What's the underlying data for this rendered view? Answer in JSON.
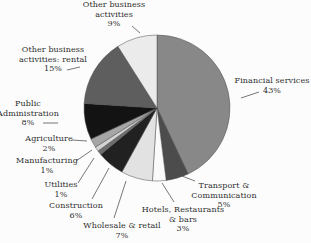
{
  "chart_data": {
    "type": "pie",
    "title": "",
    "direction": "clockwise",
    "start_angle_deg": 0,
    "legend": "none",
    "slices": [
      {
        "label": "Financial services",
        "pct": 43,
        "percent_label": "43%",
        "color": "#888888"
      },
      {
        "label": "Transport & Communication",
        "pct": 5,
        "percent_label": "5%",
        "color": "#4c4c4c"
      },
      {
        "label": "Hotels, Restaurants & bars",
        "pct": 3,
        "percent_label": "3%",
        "color": "#fafafa"
      },
      {
        "label": "Wholesale & retail",
        "pct": 7,
        "percent_label": "7%",
        "color": "#e2e2e2"
      },
      {
        "label": "Construction",
        "pct": 6,
        "percent_label": "6%",
        "color": "#212121"
      },
      {
        "label": "Utilities",
        "pct": 1,
        "percent_label": "1%",
        "color": "#6e6e6e"
      },
      {
        "label": "Manufacturing",
        "pct": 1,
        "percent_label": "1%",
        "color": "#d4d4d4"
      },
      {
        "label": "Agriculture",
        "pct": 2,
        "percent_label": "2%",
        "color": "#a6a6a6"
      },
      {
        "label": "Public Administration",
        "pct": 8,
        "percent_label": "8%",
        "color": "#131313"
      },
      {
        "label": "Other business activities: rental",
        "pct": 15,
        "percent_label": "15%",
        "color": "#5e5e5e"
      },
      {
        "label": "Other business activities",
        "pct": 9,
        "percent_label": "9%",
        "color": "#ebebeb"
      }
    ],
    "layout": {
      "center": {
        "x": 157,
        "y": 108
      },
      "radius": 73,
      "slice_stroke": "#4d4d4d",
      "slice_stroke_width": 0.5,
      "leader_color": "#555555",
      "leader_width": 0.8,
      "labels": [
        {
          "lines": [
            "Financial services",
            "43%"
          ],
          "x": 272,
          "y": 76,
          "leader": [
            241,
            98,
            259,
            92
          ]
        },
        {
          "lines": [
            "Transport &",
            "Communication",
            "5%"
          ],
          "x": 224,
          "y": 181,
          "leader": [
            182,
            176,
            195,
            181
          ]
        },
        {
          "lines": [
            "Hotels, Restaurants",
            "& bars",
            "3%"
          ],
          "x": 183,
          "y": 205,
          "leader": [
            162,
            183,
            174,
            202
          ]
        },
        {
          "lines": [
            "Wholesale & retail",
            "7%"
          ],
          "x": 122,
          "y": 221,
          "leader": [
            126,
            181,
            114,
            218
          ]
        },
        {
          "lines": [
            "Construction",
            "6%"
          ],
          "x": 76,
          "y": 201,
          "leader": [
            109,
            168,
            92,
            199
          ]
        },
        {
          "lines": [
            "Utilities",
            "1%"
          ],
          "x": 61,
          "y": 180,
          "leader": [
            94,
            158,
            78,
            183
          ]
        },
        {
          "lines": [
            "Manufacturing",
            "1%"
          ],
          "x": 47,
          "y": 156,
          "leader": [
            92,
            150,
            76,
            161
          ]
        },
        {
          "lines": [
            "Agriculture",
            "2%"
          ],
          "x": 49,
          "y": 134,
          "leader": [
            87,
            141,
            72,
            140
          ]
        },
        {
          "lines": [
            "Public",
            "Administration",
            "8%"
          ],
          "x": 28,
          "y": 99,
          "leader": [
            43,
            123,
            58,
            123
          ]
        },
        {
          "lines": [
            "Other business",
            "activities: rental",
            "15%"
          ],
          "x": 53,
          "y": 45,
          "leader": [
            67,
            70,
            80,
            67
          ]
        },
        {
          "lines": [
            "Other business",
            "activities",
            "9%"
          ],
          "x": 114,
          "y": 0,
          "leader": [
            132,
            26,
            140,
            33
          ]
        }
      ]
    }
  }
}
